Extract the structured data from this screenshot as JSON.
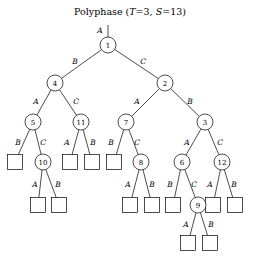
{
  "figure": {
    "title_prefix": "Polyphase (",
    "title_t_var": "T",
    "title_t_eq": "=3,",
    "title_s_var": "S",
    "title_s_eq": "=13)",
    "title_suffix": ")",
    "width": 260,
    "height": 258,
    "background": "#ffffff",
    "stroke_color": "#000000"
  },
  "chart_data": {
    "type": "diagram",
    "subtype": "tree",
    "title": "Polyphase (T=3, S=13)",
    "parameters": {
      "T": 3,
      "S": 13
    },
    "node_count": 12,
    "leaf_count": 13,
    "edge_label_alphabet": [
      "A",
      "B",
      "C"
    ],
    "root_stub_label": "A",
    "nodes": [
      {
        "id": "n1",
        "label": "1",
        "x": 108,
        "y": 45,
        "r": 8
      },
      {
        "id": "n4",
        "label": "4",
        "x": 55,
        "y": 83,
        "r": 8
      },
      {
        "id": "n2",
        "label": "2",
        "x": 165,
        "y": 83,
        "r": 8
      },
      {
        "id": "n5",
        "label": "5",
        "x": 33,
        "y": 122,
        "r": 8
      },
      {
        "id": "n11",
        "label": "11",
        "x": 81,
        "y": 122,
        "r": 8
      },
      {
        "id": "n7",
        "label": "7",
        "x": 126,
        "y": 122,
        "r": 8
      },
      {
        "id": "n3",
        "label": "3",
        "x": 205,
        "y": 122,
        "r": 8
      },
      {
        "id": "n10",
        "label": "10",
        "x": 43,
        "y": 162,
        "r": 8
      },
      {
        "id": "n8",
        "label": "8",
        "x": 141,
        "y": 162,
        "r": 8
      },
      {
        "id": "n6",
        "label": "6",
        "x": 182,
        "y": 162,
        "r": 8
      },
      {
        "id": "n12",
        "label": "12",
        "x": 222,
        "y": 162,
        "r": 8
      },
      {
        "id": "n9",
        "label": "9",
        "x": 198,
        "y": 205,
        "r": 8
      }
    ],
    "leaves": [
      {
        "id": "L1",
        "x": 15,
        "y": 162,
        "size": 15
      },
      {
        "id": "L2",
        "x": 70,
        "y": 162,
        "size": 15
      },
      {
        "id": "L3",
        "x": 92,
        "y": 162,
        "size": 15
      },
      {
        "id": "L4",
        "x": 114,
        "y": 162,
        "size": 15
      },
      {
        "id": "L5",
        "x": 38,
        "y": 205,
        "size": 15
      },
      {
        "id": "L6",
        "x": 59,
        "y": 205,
        "size": 15
      },
      {
        "id": "L7",
        "x": 130,
        "y": 205,
        "size": 15
      },
      {
        "id": "L8",
        "x": 152,
        "y": 205,
        "size": 15
      },
      {
        "id": "L9",
        "x": 173,
        "y": 205,
        "size": 15
      },
      {
        "id": "L10",
        "x": 213,
        "y": 205,
        "size": 15
      },
      {
        "id": "L11",
        "x": 235,
        "y": 205,
        "size": 15
      },
      {
        "id": "L12",
        "x": 188,
        "y": 243,
        "size": 15
      },
      {
        "id": "L13",
        "x": 210,
        "y": 243,
        "size": 15
      }
    ],
    "edges": [
      {
        "from": "n1",
        "to": "n4",
        "label": "B",
        "lx": 75,
        "ly": 61
      },
      {
        "from": "n1",
        "to": "n2",
        "label": "C",
        "lx": 143,
        "ly": 61
      },
      {
        "from": "n4",
        "to": "n5",
        "label": "A",
        "lx": 36,
        "ly": 101
      },
      {
        "from": "n4",
        "to": "n11",
        "label": "C",
        "lx": 76,
        "ly": 101
      },
      {
        "from": "n2",
        "to": "n7",
        "label": "A",
        "lx": 137,
        "ly": 101
      },
      {
        "from": "n2",
        "to": "n3",
        "label": "B",
        "lx": 190,
        "ly": 101
      },
      {
        "from": "n5",
        "to": "L1",
        "label": "B",
        "lx": 18,
        "ly": 142
      },
      {
        "from": "n5",
        "to": "n10",
        "label": "C",
        "lx": 43,
        "ly": 142
      },
      {
        "from": "n11",
        "to": "L2",
        "label": "A",
        "lx": 67,
        "ly": 142
      },
      {
        "from": "n11",
        "to": "L3",
        "label": "B",
        "lx": 93,
        "ly": 142
      },
      {
        "from": "n7",
        "to": "L4",
        "label": "B",
        "lx": 111,
        "ly": 142
      },
      {
        "from": "n7",
        "to": "n8",
        "label": "C",
        "lx": 137,
        "ly": 142
      },
      {
        "from": "n3",
        "to": "n6",
        "label": "A",
        "lx": 187,
        "ly": 142
      },
      {
        "from": "n3",
        "to": "n12",
        "label": "C",
        "lx": 220,
        "ly": 142
      },
      {
        "from": "n10",
        "to": "L5",
        "label": "A",
        "lx": 35,
        "ly": 184
      },
      {
        "from": "n10",
        "to": "L6",
        "label": "B",
        "lx": 58,
        "ly": 184
      },
      {
        "from": "n8",
        "to": "L7",
        "label": "A",
        "lx": 128,
        "ly": 184
      },
      {
        "from": "n8",
        "to": "L8",
        "label": "B",
        "lx": 152,
        "ly": 184
      },
      {
        "from": "n6",
        "to": "L9",
        "label": "B",
        "lx": 170,
        "ly": 184
      },
      {
        "from": "n6",
        "to": "n9",
        "label": "C",
        "lx": 194,
        "ly": 184
      },
      {
        "from": "n12",
        "to": "L10",
        "label": "A",
        "lx": 210,
        "ly": 184
      },
      {
        "from": "n12",
        "to": "L11",
        "label": "B",
        "lx": 234,
        "ly": 184
      },
      {
        "from": "n9",
        "to": "L12",
        "label": "A",
        "lx": 186,
        "ly": 224
      },
      {
        "from": "n9",
        "to": "L13",
        "label": "B",
        "lx": 211,
        "ly": 224
      }
    ],
    "root_stub": {
      "x": 108,
      "y_top": 25,
      "y_bottom": 37,
      "label": "A",
      "lx": 100,
      "ly": 30
    }
  }
}
